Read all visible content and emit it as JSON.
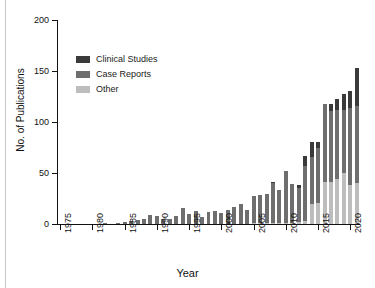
{
  "chart_data": {
    "type": "bar",
    "subtype": "stacked-vertical",
    "title": "",
    "xlabel": "Year",
    "ylabel": "No. of Publications",
    "ylim": [
      0,
      200
    ],
    "y_ticks": [
      0,
      50,
      100,
      150,
      200
    ],
    "x_ticks": [
      "1975",
      "1980",
      "1985",
      "1990",
      "1995",
      "2000",
      "2005",
      "2010",
      "2015",
      "2020"
    ],
    "grid": false,
    "legend_position": "upper-left-inside",
    "categories": [
      "1975",
      "1976",
      "1977",
      "1978",
      "1979",
      "1980",
      "1981",
      "1982",
      "1983",
      "1984",
      "1985",
      "1986",
      "1987",
      "1988",
      "1989",
      "1990",
      "1991",
      "1992",
      "1993",
      "1994",
      "1995",
      "1996",
      "1997",
      "1998",
      "1999",
      "2000",
      "2001",
      "2002",
      "2003",
      "2004",
      "2005",
      "2006",
      "2007",
      "2008",
      "2009",
      "2010",
      "2011",
      "2012",
      "2013",
      "2014",
      "2015",
      "2016",
      "2017",
      "2018",
      "2019",
      "2020",
      "2021"
    ],
    "series": [
      {
        "name": "Other",
        "color": "#bdbdbd",
        "values": [
          0,
          0,
          0,
          0,
          0,
          0,
          0,
          0,
          0,
          0,
          0,
          0,
          0,
          0,
          0,
          0,
          0,
          0,
          0,
          0,
          0,
          0,
          0,
          0,
          0,
          0,
          0,
          0,
          0,
          0,
          1,
          1,
          1,
          1,
          1,
          1,
          1,
          2,
          3,
          20,
          21,
          41,
          41,
          44,
          50,
          38,
          40
        ]
      },
      {
        "name": "Case Reports",
        "color": "#6e6e6e",
        "values": [
          0,
          0,
          0,
          0,
          0,
          0,
          0,
          1,
          0,
          1,
          2,
          3,
          4,
          5,
          9,
          8,
          5,
          5,
          8,
          16,
          10,
          13,
          7,
          12,
          13,
          11,
          14,
          17,
          20,
          14,
          26,
          27,
          28,
          39,
          32,
          51,
          38,
          33,
          54,
          46,
          54,
          77,
          70,
          68,
          62,
          76,
          76
        ]
      },
      {
        "name": "Clinical Studies",
        "color": "#3a3a3a",
        "values": [
          0,
          0,
          0,
          0,
          0,
          0,
          0,
          0,
          0,
          0,
          0,
          0,
          0,
          0,
          0,
          0,
          0,
          0,
          0,
          0,
          0,
          0,
          0,
          0,
          0,
          0,
          0,
          0,
          0,
          0,
          0,
          0,
          0,
          1,
          0,
          0,
          0,
          3,
          10,
          14,
          5,
          0,
          7,
          11,
          15,
          16,
          37
        ]
      }
    ],
    "totals": [
      0,
      0,
      0,
      0,
      0,
      0,
      0,
      1,
      0,
      1,
      2,
      3,
      4,
      5,
      9,
      8,
      5,
      5,
      8,
      16,
      10,
      13,
      7,
      12,
      13,
      11,
      14,
      17,
      20,
      14,
      27,
      28,
      29,
      41,
      33,
      52,
      39,
      38,
      67,
      80,
      80,
      118,
      118,
      123,
      127,
      130,
      153
    ]
  },
  "legend": {
    "items": [
      {
        "label": "Clinical Studies",
        "color": "#3a3a3a"
      },
      {
        "label": "Case Reports",
        "color": "#6e6e6e"
      },
      {
        "label": "Other",
        "color": "#bdbdbd"
      }
    ]
  },
  "axes": {
    "x_title": "Year",
    "y_title": "No. of Publications"
  }
}
